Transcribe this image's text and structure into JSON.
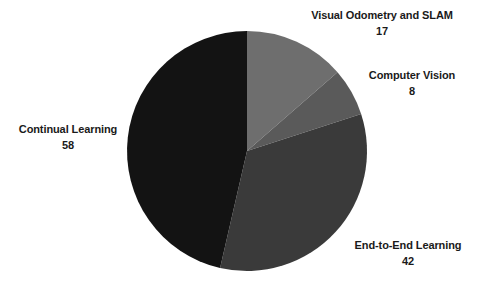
{
  "chart_data": {
    "type": "pie",
    "title": "",
    "subtitle": "",
    "xlabel": "",
    "ylabel": "",
    "categories": [
      "Visual Odometry and SLAM",
      "Computer Vision",
      "End-to-End Learning",
      "Continual Learning"
    ],
    "values": [
      17,
      8,
      42,
      58
    ],
    "total": 125,
    "start_angle_deg": 0,
    "direction": "clockwise",
    "grid": false,
    "legend": "none",
    "labels_position": "outside",
    "label_format": "name and value on separate lines",
    "slices": [
      {
        "label": "Visual Odometry and SLAM",
        "value": 17,
        "color": "#6e6e6e",
        "angle_deg": 48.96
      },
      {
        "label": "Computer Vision",
        "value": 8,
        "color": "#5a5a5a",
        "angle_deg": 23.04
      },
      {
        "label": "End-to-End Learning",
        "value": 42,
        "color": "#3a3a3a",
        "angle_deg": 120.96
      },
      {
        "label": "Continual Learning",
        "value": 58,
        "color": "#131313",
        "angle_deg": 167.04
      }
    ],
    "background_color": "#ffffff",
    "text_color": "#1a1a1a"
  },
  "labels": {
    "visual_odometry": {
      "name": "Visual Odometry and SLAM",
      "value": "17"
    },
    "computer_vision": {
      "name": "Computer Vision",
      "value": "8"
    },
    "end_to_end": {
      "name": "End-to-End Learning",
      "value": "42"
    },
    "continual": {
      "name": "Continual Learning",
      "value": "58"
    }
  }
}
